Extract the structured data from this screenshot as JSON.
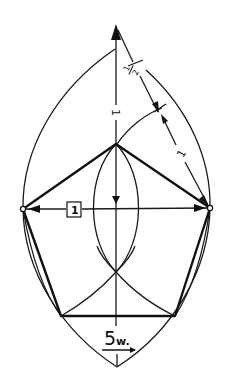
{
  "diagram": {
    "colors": {
      "ink": "#111111",
      "background": "#ffffff"
    },
    "labels": {
      "half_label_num": "1",
      "half_label_den": "2",
      "vertical_unit_label": "1",
      "diagonal_unit_label": "1",
      "boxed_width_label": "1",
      "bottom_label": "5w."
    },
    "points": {
      "arrow_tip_top": [
        116,
        25
      ],
      "outer_apex_top": [
        115,
        49
      ],
      "pentagon_top": [
        116,
        144
      ],
      "pentagon_left": [
        23,
        209
      ],
      "pentagon_right": [
        210,
        208
      ],
      "pentagon_bottom_left": [
        61,
        316
      ],
      "pentagon_bottom_right": [
        175,
        316
      ],
      "outer_apex_bottom": [
        117,
        367
      ],
      "lens_top": [
        116,
        144
      ],
      "lens_bottom": [
        116,
        272
      ]
    },
    "elements": [
      "outer pointed-oval (vesica) outline",
      "inner lens between arcs",
      "vertical axis with arrows",
      "horizontal width arrow labelled 1 (boxed)",
      "diagonal measure from top tip labelled 1/2 and 1",
      "arc from pentagon-top swinging to the diagonal",
      "regular pentagon drawn with heavy lines",
      "lower arcs crossing at axis",
      "caption 5w. (five-sided, width)"
    ]
  }
}
